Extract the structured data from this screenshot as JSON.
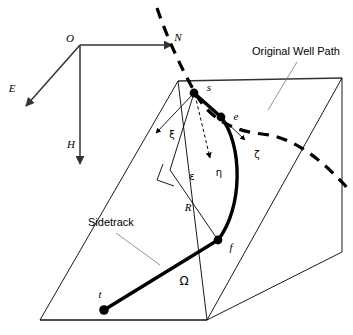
{
  "figure": {
    "background": "#ffffff",
    "ink": "#000000"
  },
  "axes": {
    "origin_label": "O",
    "north_label": "N",
    "east_label": "E",
    "depth_label": "H"
  },
  "points": {
    "start": "s",
    "end": "e",
    "fillet": "f",
    "target": "t"
  },
  "greek": {
    "xi": "ξ",
    "eta": "η",
    "zeta": "ζ",
    "epsilon": "ε",
    "omega": "Ω"
  },
  "dimensions": {
    "radius_label": "R"
  },
  "annotations": {
    "original_well_path": "Original Well Path",
    "sidetrack": "Sidetrack"
  },
  "colors": {
    "stroke": "#000000",
    "plane_edge": "#333333",
    "leader": "#777777"
  }
}
